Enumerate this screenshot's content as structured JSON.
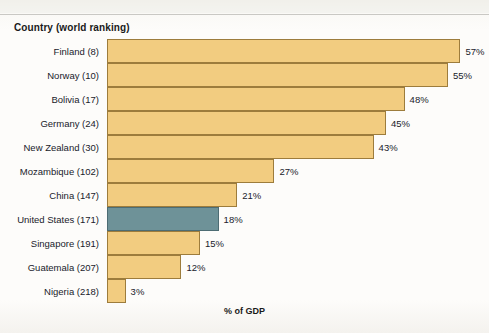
{
  "chart_data": {
    "type": "bar",
    "orientation": "horizontal",
    "title": "",
    "axis_header": "Country (world ranking)",
    "xlabel": "% of GDP",
    "ylabel": "",
    "xlim": [
      0,
      60
    ],
    "grid": false,
    "legend": null,
    "value_suffix": "%",
    "categories": [
      "Finland  (8)",
      "Norway  (10)",
      "Bolivia (17)",
      "Germany (24)",
      "New Zealand (30)",
      "Mozambique (102)",
      "China (147)",
      "United States  (171)",
      "Singapore (191)",
      "Guatemala (207)",
      "Nigeria (218)"
    ],
    "values": [
      57,
      55,
      48,
      45,
      43,
      27,
      21,
      18,
      15,
      12,
      3
    ],
    "value_labels": [
      "57%",
      "55%",
      "48%",
      "45%",
      "43%",
      "27%",
      "21%",
      "18%",
      "15%",
      "12%",
      "3%"
    ],
    "highlight_index": 7,
    "colors": {
      "bar_fill": "#F2CC80",
      "bar_border": "#9D7C3C",
      "highlight_fill": "#6E9298",
      "highlight_border": "#4D6C73",
      "text": "#20222B",
      "background": "#FBFAF7",
      "rule": "#C9C8C4"
    }
  }
}
